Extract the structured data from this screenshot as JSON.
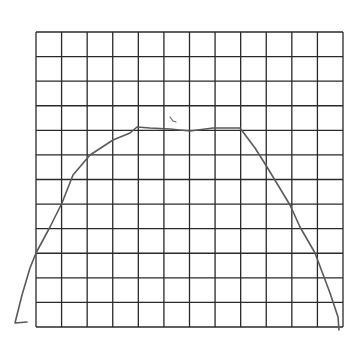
{
  "figure": {
    "background": "#ffffff",
    "grid": {
      "columns": 12,
      "rows": 12,
      "left": 36,
      "top": 32,
      "right": 343,
      "bottom": 327,
      "line_color": "#2a2a2a"
    },
    "curve": {
      "color": "#5a5a5a",
      "points": [
        [
          27,
          322
        ],
        [
          15,
          323
        ],
        [
          22,
          295
        ],
        [
          30,
          268
        ],
        [
          36,
          253
        ],
        [
          50,
          227
        ],
        [
          62,
          203
        ],
        [
          73,
          175
        ],
        [
          90,
          155
        ],
        [
          113,
          140
        ],
        [
          130,
          133
        ],
        [
          137,
          127
        ],
        [
          150,
          128
        ],
        [
          170,
          129
        ],
        [
          190,
          131
        ],
        [
          213,
          128
        ],
        [
          240,
          128
        ],
        [
          255,
          148
        ],
        [
          267,
          167
        ],
        [
          290,
          205
        ],
        [
          300,
          227
        ],
        [
          315,
          253
        ],
        [
          330,
          293
        ],
        [
          338,
          317
        ],
        [
          339,
          330
        ]
      ]
    },
    "stray_mark": {
      "color": "#6a6a6a",
      "points": [
        [
          170,
          117
        ],
        [
          173,
          121
        ],
        [
          176,
          122
        ]
      ]
    }
  }
}
